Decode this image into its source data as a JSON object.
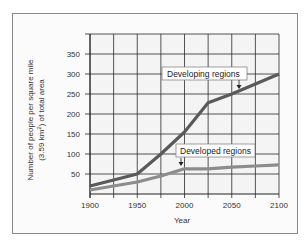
{
  "chart_data": {
    "type": "line",
    "title": "",
    "xlabel": "Year",
    "ylabel": "Number of people per square mile (3.59 km²) of total area",
    "ylabel_lines": [
      "Number of people per square mile",
      "(3.59 km",
      "2",
      ") of total area"
    ],
    "x": [
      1900,
      1925,
      1950,
      1975,
      2000,
      2025,
      2050,
      2075,
      2100
    ],
    "xticks": [
      "1900",
      "1950",
      "2000",
      "2050",
      "2100"
    ],
    "xtick_values": [
      1900,
      1950,
      2000,
      2050,
      2100
    ],
    "yticks": [
      "50",
      "100",
      "150",
      "200",
      "250",
      "300",
      "350"
    ],
    "ytick_values": [
      50,
      100,
      150,
      200,
      250,
      300,
      350
    ],
    "xlim": [
      1900,
      2100
    ],
    "ylim": [
      0,
      400
    ],
    "grid": true,
    "series": [
      {
        "name": "Developing regions",
        "color": "#5a5a5a",
        "x": [
          1900,
          1950,
          1975,
          2000,
          2025,
          2050,
          2075,
          2100
        ],
        "values": [
          20,
          50,
          100,
          155,
          228,
          250,
          275,
          300
        ]
      },
      {
        "name": "Developed regions",
        "color": "#8c8c8c",
        "x": [
          1900,
          1925,
          1950,
          1975,
          2000,
          2025,
          2050,
          2075,
          2100
        ],
        "values": [
          10,
          20,
          30,
          45,
          63,
          63,
          67,
          70,
          73
        ]
      }
    ],
    "annotations": [
      {
        "text": "Developing regions",
        "arrow_x": 2055,
        "arrow_y": 252
      },
      {
        "text": "Developed regions",
        "arrow_x": 1995,
        "arrow_y": 66
      }
    ]
  }
}
